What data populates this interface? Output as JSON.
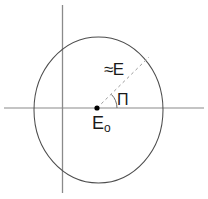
{
  "figure": {
    "background_color": "#ffffff",
    "width": 208,
    "height": 199,
    "type": "geometric-diagram"
  },
  "colors": {
    "axis": "#8a8a8a",
    "circle": "#4d4d4d",
    "dashed": "#9a9a9a",
    "arc": "#6a6a6a",
    "point": "#000000",
    "text": "#1a1a1a"
  },
  "geometry": {
    "circle": {
      "center_x": 98.5,
      "center_y": 110,
      "radius_x": 64.5,
      "radius_y": 73
    },
    "horizontal_axis": {
      "x1": 4,
      "y1": 108,
      "x2": 204,
      "y2": 108
    },
    "vertical_axis": {
      "x1": 62.5,
      "y1": 5,
      "x2": 62.5,
      "y2": 193
    },
    "center_point": {
      "cx": 97,
      "cy": 108,
      "r": 2.6
    },
    "radius_line": {
      "x1": 97,
      "y1": 108,
      "x2": 149,
      "y2": 57,
      "dash": "3 3"
    },
    "angle_arc": {
      "start_x": 117,
      "start_y": 108,
      "end_x": 111.5,
      "end_y": 94.5,
      "radius": 20
    }
  },
  "labels": {
    "radius": "≈E",
    "angle": "Π",
    "center_base": "E",
    "center_sub": "o"
  }
}
